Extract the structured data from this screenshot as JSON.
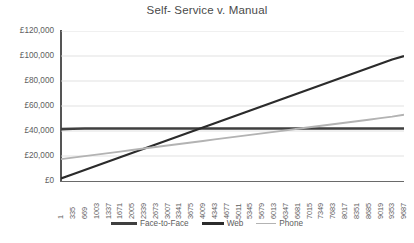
{
  "chart_data": {
    "type": "line",
    "title": "Self- Service v. Manual",
    "xlabel": "",
    "ylabel": "",
    "ylim": [
      0,
      120000
    ],
    "y_tick_labels": [
      "£120,000",
      "£100,000",
      "£80,000",
      "£60,000",
      "£40,000",
      "£20,000",
      "£0"
    ],
    "y_tick_values": [
      120000,
      100000,
      80000,
      60000,
      40000,
      20000,
      0
    ],
    "grid": "horizontal",
    "legend_position": "bottom",
    "x": [
      1,
      335,
      669,
      1003,
      1337,
      1671,
      2005,
      2339,
      2673,
      3007,
      3341,
      3675,
      4009,
      4343,
      4677,
      5011,
      5345,
      5679,
      6013,
      6347,
      6681,
      7015,
      7349,
      7683,
      8017,
      8351,
      8685,
      9019,
      9353,
      9687
    ],
    "x_tick_labels": [
      "1",
      "335",
      "669",
      "1003",
      "1337",
      "1671",
      "2005",
      "2339",
      "2673",
      "3007",
      "3341",
      "3675",
      "4009",
      "4343",
      "4677",
      "5011",
      "5345",
      "5679",
      "6013",
      "6347",
      "6681",
      "7015",
      "7349",
      "7683",
      "8017",
      "8351",
      "8685",
      "9019",
      "9353",
      "9687"
    ],
    "series": [
      {
        "name": "Face-to-Face",
        "color": "#3f3f3f",
        "width": 2.6,
        "values": [
          41500,
          41800,
          42000,
          42000,
          42000,
          42000,
          42000,
          42000,
          42000,
          42000,
          42000,
          42000,
          42000,
          42000,
          42000,
          42000,
          42000,
          42000,
          42000,
          42000,
          42000,
          42000,
          42000,
          42000,
          42000,
          42000,
          42000,
          42000,
          42000,
          42000
        ]
      },
      {
        "name": "Web",
        "color": "#2b2b2b",
        "width": 2.2,
        "values": [
          2000,
          5400,
          8800,
          12200,
          15600,
          19000,
          22400,
          25800,
          29200,
          32600,
          36000,
          39400,
          42800,
          46200,
          49600,
          53000,
          56400,
          59800,
          63200,
          66600,
          70000,
          73400,
          76800,
          80200,
          83600,
          87000,
          90400,
          93800,
          97200,
          100000
        ]
      },
      {
        "name": "Phone",
        "color": "#b3b3b3",
        "width": 1.8,
        "values": [
          17500,
          18700,
          19900,
          21100,
          22300,
          23500,
          24800,
          26000,
          27200,
          28400,
          29600,
          30800,
          32000,
          33300,
          34500,
          35700,
          36900,
          38100,
          39300,
          40500,
          41800,
          43000,
          44200,
          45400,
          46600,
          47800,
          49000,
          50300,
          51500,
          53000
        ]
      }
    ]
  },
  "legend": {
    "items": [
      {
        "label": "Face-to-Face"
      },
      {
        "label": "Web"
      },
      {
        "label": "Phone"
      }
    ]
  }
}
